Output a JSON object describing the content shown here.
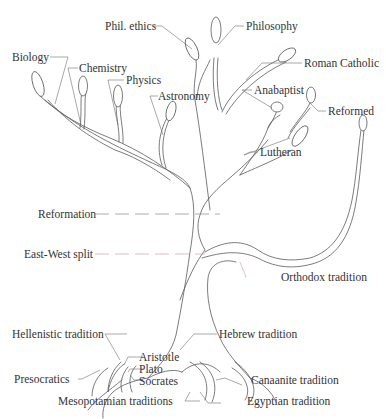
{
  "diagram": {
    "type": "tree-of-knowledge",
    "line_color": "#5a5a5a",
    "text_color": "#333333",
    "accent_color": "#c99a9a",
    "labels": {
      "phil_ethics": "Phil. ethics",
      "philosophy": "Philosophy",
      "roman_catholic": "Roman Catholic",
      "biology": "Biology",
      "chemistry": "Chemistry",
      "physics": "Physics",
      "astronomy": "Astronomy",
      "anabaptist": "Anabaptist",
      "reformed": "Reformed",
      "lutheran": "Lutheran",
      "reformation": "Reformation",
      "east_west_split": "East-West split",
      "orthodox_tradition": "Orthodox tradition",
      "hellenistic_tradition": "Hellenistic tradition",
      "hebrew_tradition": "Hebrew tradition",
      "presocratics": "Presocratics",
      "aristotle": "Aristotle",
      "plato": "Plato",
      "socrates": "Socrates",
      "canaanite_tradition": "Canaanite tradition",
      "mesopotamian_traditions": "Mesopotamian traditions",
      "egyptian_tradition": "Egyptian tradition"
    },
    "branches": {
      "sciences": [
        "Biology",
        "Chemistry",
        "Physics",
        "Astronomy"
      ],
      "philosophy": [
        "Phil. ethics",
        "Philosophy"
      ],
      "western_christianity": [
        "Roman Catholic",
        "Anabaptist",
        "Reformed",
        "Lutheran"
      ],
      "eastern_christianity": [
        "Orthodox tradition"
      ],
      "roots_left": [
        "Hellenistic tradition",
        "Presocratics",
        "Aristotle",
        "Plato",
        "Socrates",
        "Mesopotamian traditions"
      ],
      "roots_right": [
        "Hebrew tradition",
        "Canaanite tradition",
        "Egyptian tradition"
      ]
    },
    "events": [
      "Reformation",
      "East-West split"
    ]
  }
}
